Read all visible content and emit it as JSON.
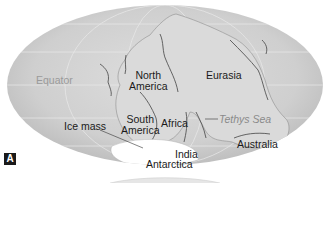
{
  "figure": {
    "panel_label": "A",
    "projection": "elliptical world map (Mollweide-like) of Pangaea supercontinent"
  },
  "labels": {
    "equator": "Equator",
    "north_america_1": "North",
    "north_america_2": "America",
    "eurasia": "Eurasia",
    "south_america_1": "South",
    "south_america_2": "America",
    "africa": "Africa",
    "tethys_sea": "Tethys Sea",
    "ice_mass": "Ice mass",
    "australia": "Australia",
    "india": "India",
    "antarctica": "Antarctica"
  },
  "colors": {
    "ocean": "#cfcfcf",
    "land": "#d9d9d9",
    "ice": "#ffffff",
    "text": "#1a1a1a",
    "muted_text": "#9a9a9a"
  }
}
